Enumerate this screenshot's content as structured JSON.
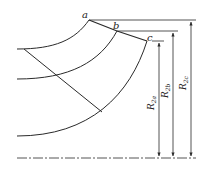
{
  "diagram": {
    "type": "impeller blade meridional section with outlet radii",
    "colors": {
      "line": "#2a2a2a",
      "background": "#ffffff"
    },
    "points": {
      "a": {
        "label": "a"
      },
      "b": {
        "label": "b"
      },
      "c": {
        "label": "c"
      }
    },
    "dimensions": [
      {
        "id": "R2a",
        "label_main": "R",
        "label_sub": "2a"
      },
      {
        "id": "R2b",
        "label_main": "R",
        "label_sub": "2b"
      },
      {
        "id": "R2c",
        "label_main": "R",
        "label_sub": "2c"
      }
    ],
    "centerline": {
      "style": "dash-dot"
    }
  }
}
